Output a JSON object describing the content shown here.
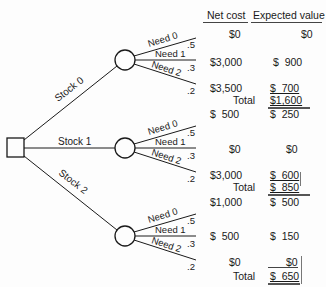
{
  "diagram": {
    "type": "decision-tree",
    "decision_node": {
      "shape": "square"
    },
    "branches": [
      {
        "label": "Stock 0",
        "chance_node": {
          "shape": "circle"
        },
        "outcomes": [
          {
            "label": "Need 0",
            "probability": ".5",
            "net_cost": "$0",
            "expected_value": "$0"
          },
          {
            "label": "Need 1",
            "probability": ".3",
            "net_cost": "$3,000",
            "expected_value": "$  900"
          },
          {
            "label": "Need 2",
            "probability": ".2",
            "net_cost": "$3,500",
            "expected_value": "$  700"
          }
        ],
        "total_label": "Total",
        "total": "$1,600"
      },
      {
        "label": "Stock 1",
        "chance_node": {
          "shape": "circle"
        },
        "outcomes": [
          {
            "label": "Need 0",
            "probability": ".5",
            "net_cost": "$  500",
            "expected_value": "$  250"
          },
          {
            "label": "Need 1",
            "probability": ".3",
            "net_cost": "$0",
            "expected_value": "$0"
          },
          {
            "label": "Need 2",
            "probability": ".2",
            "net_cost": "$3,000",
            "expected_value": "$  600"
          }
        ],
        "total_label": "Total",
        "total": "$  850"
      },
      {
        "label": "Stock 2",
        "chance_node": {
          "shape": "circle"
        },
        "outcomes": [
          {
            "label": "Need 0",
            "probability": ".5",
            "net_cost": "$1,000",
            "expected_value": "$  500"
          },
          {
            "label": "Need 1",
            "probability": ".3",
            "net_cost": "$  500",
            "expected_value": "$  150"
          },
          {
            "label": "Need 2",
            "probability": ".2",
            "net_cost": "$0",
            "expected_value": "$0"
          }
        ],
        "total_label": "Total",
        "total": "$  650"
      }
    ]
  },
  "columns": {
    "net_cost": "Net cost",
    "expected_value": "Expected value"
  },
  "colors": {
    "line": "#1a1a1a",
    "text": "#1a1a1a",
    "background": "#fdfdfd"
  }
}
